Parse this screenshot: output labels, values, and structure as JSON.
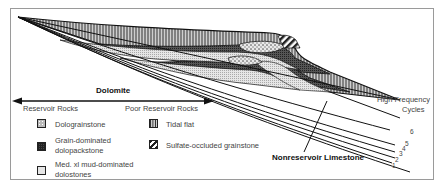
{
  "figure": {
    "title_dolomite": "Dolomite",
    "arrow_left_label": "Reservoir Rocks",
    "arrow_right_label": "Poor Reservoir Rocks",
    "cycles_label_line1": "High Frequency",
    "cycles_label_line2": "Cycles",
    "cycle_numbers": [
      "1",
      "2",
      "3",
      "4",
      "5",
      "6"
    ],
    "nonreservoir_label": "Nonreservoir Limestone"
  },
  "legend": {
    "reservoir": [
      {
        "label": "Dolograinstone",
        "pattern": "coarse-dots"
      },
      {
        "label_line1": "Grain-dominated",
        "label_line2": "dolopackstone",
        "pattern": "dark-grid"
      },
      {
        "label_line1": "Med. xl mud-dominated",
        "label_line2": "dolostones",
        "pattern": "fine-stipple"
      }
    ],
    "poor_reservoir": [
      {
        "label": "Tidal flat",
        "pattern": "vertical-lines"
      },
      {
        "label": "Sulfate-occluded grainstone",
        "pattern": "diagonal-hatch"
      }
    ]
  },
  "colors": {
    "line": "#1a1a1a",
    "frame": "#9a9a9a",
    "text": "#444444"
  }
}
